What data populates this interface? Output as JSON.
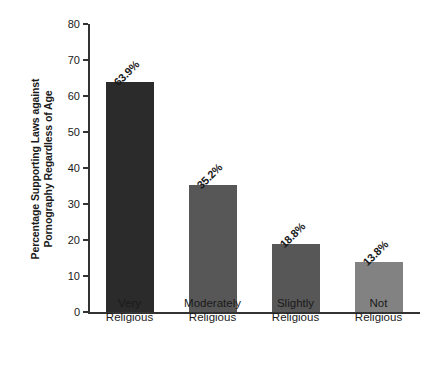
{
  "chart_data": {
    "type": "bar",
    "title": "",
    "subtitle": "",
    "xlabel": "",
    "ylabel": "Percentage Supporting Laws against Pornography Regardless of Age",
    "ylabel_lines": [
      "Percentage Supporting Laws against",
      "Pornography Regardless of Age"
    ],
    "categories": [
      "Very Religious",
      "Moderately Religious",
      "Slightly Religious",
      "Not Religious"
    ],
    "category_lines": [
      [
        "Very",
        "Religious"
      ],
      [
        "Moderately",
        "Religious"
      ],
      [
        "Slightly",
        "Religious"
      ],
      [
        "Not",
        "Religious"
      ]
    ],
    "values": [
      63.9,
      35.2,
      18.8,
      13.8
    ],
    "value_labels": [
      "63.9%",
      "35.2%",
      "18.8%",
      "13.8%"
    ],
    "bar_colors": [
      "#2b2b2b",
      "#575757",
      "#575757",
      "#828282"
    ],
    "ylim": [
      0,
      80
    ],
    "yticks": [
      0,
      10,
      20,
      30,
      40,
      50,
      60,
      70,
      80
    ],
    "ytick_labels": [
      "0",
      "10",
      "20",
      "30",
      "40",
      "50",
      "60",
      "70",
      "80"
    ],
    "grid": false,
    "legend": false,
    "legend_position": "none",
    "axis_color": "#333333",
    "background_color": "#ffffff",
    "value_label_rotation_deg": -45
  }
}
